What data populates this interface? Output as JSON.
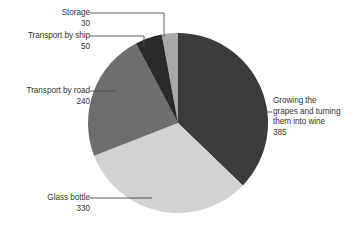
{
  "chart_data": {
    "type": "pie",
    "title": "",
    "subtitle": "",
    "xlabel": "",
    "ylabel": "",
    "legend_position": "callout-labels",
    "grid": false,
    "total": 1035,
    "unit": "",
    "categories": [
      "Growing the grapes and turning them into wine",
      "Glass bottle",
      "Transport by road",
      "Transport by ship",
      "Storage"
    ],
    "values": [
      385,
      330,
      240,
      50,
      30
    ],
    "colors": [
      "#3b3b3b",
      "#d2d2d2",
      "#6e6e6e",
      "#2b2b2b",
      "#a8a8a8"
    ],
    "slices": [
      {
        "id": "growing",
        "label_lines": [
          "Growing the",
          "grapes and turning",
          "them into wine"
        ],
        "label": "Growing the grapes and turning them into wine",
        "value": 385,
        "value_text": "385",
        "color": "#3b3b3b",
        "percent": 37.2
      },
      {
        "id": "bottle",
        "label_lines": [
          "Glass bottle"
        ],
        "label": "Glass bottle",
        "value": 330,
        "value_text": "330",
        "color": "#d2d2d2",
        "percent": 31.9
      },
      {
        "id": "road",
        "label_lines": [
          "Transport by road"
        ],
        "label": "Transport by road",
        "value": 240,
        "value_text": "240",
        "color": "#6e6e6e",
        "percent": 23.2
      },
      {
        "id": "ship",
        "label_lines": [
          "Transport by ship"
        ],
        "label": "Transport by ship",
        "value": 50,
        "value_text": "50",
        "color": "#2b2b2b",
        "percent": 4.8
      },
      {
        "id": "storage",
        "label_lines": [
          "Storage"
        ],
        "label": "Storage",
        "value": 30,
        "value_text": "30",
        "color": "#a8a8a8",
        "percent": 2.9
      }
    ]
  },
  "labels": {
    "storage": {
      "name": "Storage",
      "value": "30"
    },
    "ship": {
      "name": "Transport by ship",
      "value": "50"
    },
    "road": {
      "name": "Transport by road",
      "value": "240"
    },
    "bottle": {
      "name": "Glass bottle",
      "value": "330"
    },
    "growing": {
      "line1": "Growing the",
      "line2": "grapes and turning",
      "line3": "them into wine",
      "value": "385"
    }
  },
  "style": {
    "background": "#ffffff",
    "text_color": "#333333",
    "leader_line_color": "#4d4d4d"
  }
}
